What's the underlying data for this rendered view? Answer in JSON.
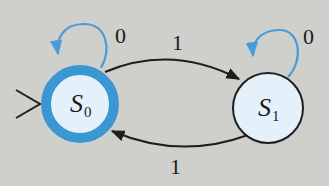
{
  "diagram": {
    "type": "finite-state-machine",
    "colors": {
      "background": "#cfcfcc",
      "accept_ring": "#3a97d4",
      "state_fill": "#e4f1fa",
      "loop_stroke": "#4a9bd6",
      "edge_stroke": "#1e1e1e"
    },
    "states": [
      {
        "id": "S0",
        "name": "S",
        "subscript": "0",
        "start": true,
        "accepting": true
      },
      {
        "id": "S1",
        "name": "S",
        "subscript": "1",
        "start": false,
        "accepting": false
      }
    ],
    "transitions": [
      {
        "from": "S0",
        "to": "S0",
        "label": "0"
      },
      {
        "from": "S0",
        "to": "S1",
        "label": "1"
      },
      {
        "from": "S1",
        "to": "S1",
        "label": "0"
      },
      {
        "from": "S1",
        "to": "S0",
        "label": "1"
      }
    ]
  }
}
